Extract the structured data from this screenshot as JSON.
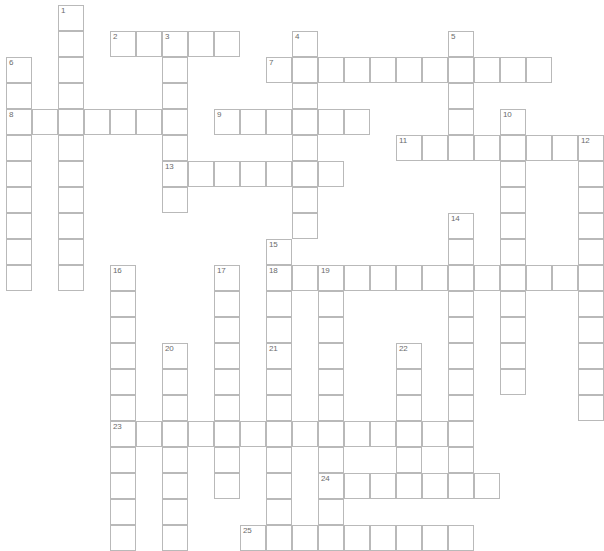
{
  "puzzle": {
    "kind": "crossword-grid",
    "title": "Crossword Puzzle Grid",
    "width_px": 578,
    "height_px": 544,
    "cell_size_px": 26,
    "origin_x_px": 6,
    "origin_y_px": 5,
    "columns": 22,
    "rows": 21,
    "colors": {
      "background": "#ffffff",
      "cell_fill": "#ffffff",
      "cell_border": "#b9b9b9",
      "number_text": "#6b6b6b"
    },
    "entries": [
      {
        "number": "1",
        "direction": "down",
        "row": 0,
        "col": 2,
        "length": 11
      },
      {
        "number": "2",
        "direction": "across",
        "row": 1,
        "col": 4,
        "length": 5
      },
      {
        "number": "3",
        "direction": "down",
        "row": 1,
        "col": 6,
        "length": 7
      },
      {
        "number": "4",
        "direction": "down",
        "row": 1,
        "col": 11,
        "length": 8
      },
      {
        "number": "5",
        "direction": "down",
        "row": 1,
        "col": 17,
        "length": 5
      },
      {
        "number": "6",
        "direction": "down",
        "row": 2,
        "col": 0,
        "length": 9
      },
      {
        "number": "7",
        "direction": "across",
        "row": 2,
        "col": 10,
        "length": 11
      },
      {
        "number": "8",
        "direction": "across",
        "row": 4,
        "col": 0,
        "length": 6
      },
      {
        "number": "9",
        "direction": "across",
        "row": 4,
        "col": 8,
        "length": 6
      },
      {
        "number": "10",
        "direction": "down",
        "row": 4,
        "col": 19,
        "length": 11
      },
      {
        "number": "11",
        "direction": "across",
        "row": 5,
        "col": 15,
        "length": 8
      },
      {
        "number": "12",
        "direction": "down",
        "row": 5,
        "col": 22,
        "length": 11
      },
      {
        "number": "13",
        "direction": "across",
        "row": 6,
        "col": 6,
        "length": 7
      },
      {
        "number": "14",
        "direction": "down",
        "row": 8,
        "col": 17,
        "length": 10
      },
      {
        "number": "15",
        "direction": "down",
        "row": 9,
        "col": 10,
        "length": 4
      },
      {
        "number": "16",
        "direction": "down",
        "row": 10,
        "col": 4,
        "length": 11
      },
      {
        "number": "17",
        "direction": "down",
        "row": 10,
        "col": 8,
        "length": 9
      },
      {
        "number": "18",
        "direction": "down",
        "row": 10,
        "col": 10,
        "length": 3
      },
      {
        "number": "18",
        "direction": "across",
        "row": 10,
        "col": 10,
        "length": 12
      },
      {
        "number": "19",
        "direction": "down",
        "row": 10,
        "col": 12,
        "length": 10
      },
      {
        "number": "20",
        "direction": "down",
        "row": 13,
        "col": 6,
        "length": 8
      },
      {
        "number": "21",
        "direction": "down",
        "row": 13,
        "col": 10,
        "length": 8
      },
      {
        "number": "22",
        "direction": "down",
        "row": 13,
        "col": 15,
        "length": 5
      },
      {
        "number": "23",
        "direction": "across",
        "row": 16,
        "col": 4,
        "length": 13
      },
      {
        "number": "24",
        "direction": "across",
        "row": 18,
        "col": 12,
        "length": 7
      },
      {
        "number": "25",
        "direction": "across",
        "row": 20,
        "col": 9,
        "length": 9
      }
    ]
  }
}
